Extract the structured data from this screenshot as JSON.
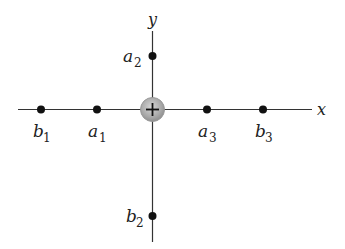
{
  "axes": {
    "x_label": "x",
    "y_label": "y",
    "color": "#333333"
  },
  "central_charge": {
    "symbol": "+",
    "fill": "#b3b3b3",
    "stroke": "#8c8c8c"
  },
  "points": [
    {
      "id": "b1",
      "base": "b",
      "sub": "1"
    },
    {
      "id": "a1",
      "base": "a",
      "sub": "1"
    },
    {
      "id": "a2",
      "base": "a",
      "sub": "2"
    },
    {
      "id": "a3",
      "base": "a",
      "sub": "3"
    },
    {
      "id": "b2",
      "base": "b",
      "sub": "2"
    },
    {
      "id": "b3",
      "base": "b",
      "sub": "3"
    }
  ],
  "colors": {
    "point": "#111111",
    "background": "#ffffff"
  }
}
